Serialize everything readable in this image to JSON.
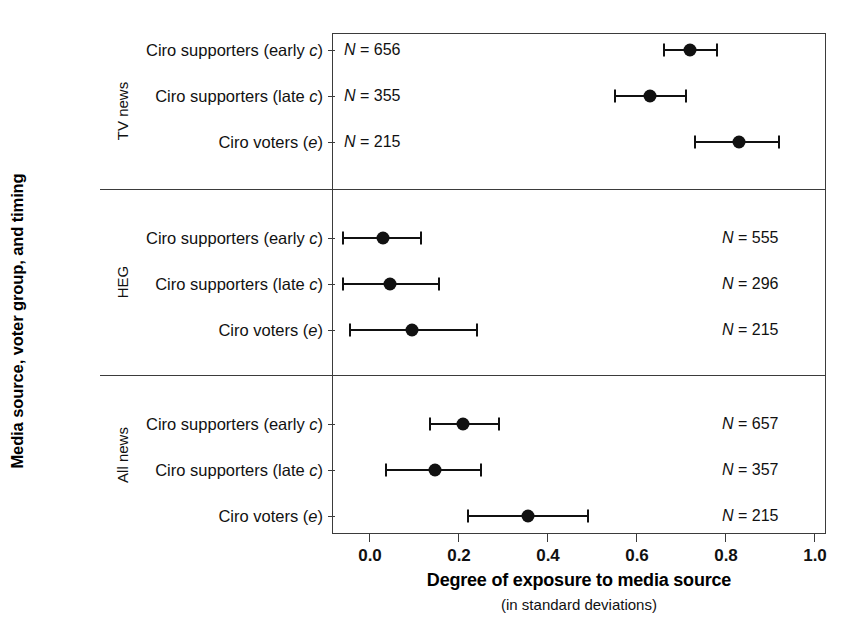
{
  "chart_data": {
    "type": "scatter",
    "title": "",
    "xlabel": "Degree of exposure to media source",
    "xlabel_sub": "(in standard deviations)",
    "ylabel": "Media source, voter group, and timing",
    "xlim": [
      -0.085,
      1.025
    ],
    "xticks": [
      0.0,
      0.2,
      0.4,
      0.6,
      0.8,
      1.0
    ],
    "xticklabels": [
      "0.0",
      "0.2",
      "0.4",
      "0.6",
      "0.8",
      "1.0"
    ],
    "grid": false,
    "legend": "none",
    "orientation": "horizontal",
    "marker": "filled-circle",
    "error_bar_style": "capped-horizontal-interval",
    "panels": [
      {
        "name": "TV news",
        "n_label_side": "left",
        "rows": [
          {
            "label_prefix": "Ciro supporters (early ",
            "label_italic": "c",
            "label_suffix": ")",
            "label_full": "Ciro supporters (early c)",
            "estimate": 0.72,
            "ci_low": 0.66,
            "ci_high": 0.78,
            "n_prefix": "N",
            "n_value": "656",
            "n_text": "N = 656"
          },
          {
            "label_prefix": "Ciro supporters (late ",
            "label_italic": "c",
            "label_suffix": ")",
            "label_full": "Ciro supporters (late c)",
            "estimate": 0.63,
            "ci_low": 0.55,
            "ci_high": 0.71,
            "n_prefix": "N",
            "n_value": "355",
            "n_text": "N = 355"
          },
          {
            "label_prefix": "Ciro voters (",
            "label_italic": "e",
            "label_suffix": ")",
            "label_full": "Ciro voters (e)",
            "estimate": 0.83,
            "ci_low": 0.73,
            "ci_high": 0.92,
            "n_prefix": "N",
            "n_value": "215",
            "n_text": "N = 215"
          }
        ]
      },
      {
        "name": "HEG",
        "n_label_side": "right",
        "rows": [
          {
            "label_prefix": "Ciro supporters (early ",
            "label_italic": "c",
            "label_suffix": ")",
            "label_full": "Ciro supporters (early c)",
            "estimate": 0.03,
            "ci_low": -0.06,
            "ci_high": 0.115,
            "n_prefix": "N",
            "n_value": "555",
            "n_text": "N = 555"
          },
          {
            "label_prefix": "Ciro supporters (late ",
            "label_italic": "c",
            "label_suffix": ")",
            "label_full": "Ciro supporters (late c)",
            "estimate": 0.045,
            "ci_low": -0.06,
            "ci_high": 0.155,
            "n_prefix": "N",
            "n_value": "296",
            "n_text": "N = 296"
          },
          {
            "label_prefix": "Ciro voters (",
            "label_italic": "e",
            "label_suffix": ")",
            "label_full": "Ciro voters (e)",
            "estimate": 0.095,
            "ci_low": -0.045,
            "ci_high": 0.24,
            "n_prefix": "N",
            "n_value": "215",
            "n_text": "N = 215"
          }
        ]
      },
      {
        "name": "All news",
        "n_label_side": "right",
        "rows": [
          {
            "label_prefix": "Ciro supporters (early ",
            "label_italic": "c",
            "label_suffix": ")",
            "label_full": "Ciro supporters (early c)",
            "estimate": 0.21,
            "ci_low": 0.135,
            "ci_high": 0.29,
            "n_prefix": "N",
            "n_value": "657",
            "n_text": "N = 657"
          },
          {
            "label_prefix": "Ciro supporters (late ",
            "label_italic": "c",
            "label_suffix": ")",
            "label_full": "Ciro supporters (late c)",
            "estimate": 0.145,
            "ci_low": 0.035,
            "ci_high": 0.25,
            "n_prefix": "N",
            "n_value": "357",
            "n_text": "N = 357"
          },
          {
            "label_prefix": "Ciro voters (",
            "label_italic": "e",
            "label_suffix": ")",
            "label_full": "Ciro voters (e)",
            "estimate": 0.355,
            "ci_low": 0.22,
            "ci_high": 0.49,
            "n_prefix": "N",
            "n_value": "215",
            "n_text": "N = 215"
          }
        ]
      }
    ],
    "colors": {
      "marker": "#111111",
      "axis": "#3b3b3b",
      "text": "#111111",
      "background": "#ffffff"
    }
  }
}
